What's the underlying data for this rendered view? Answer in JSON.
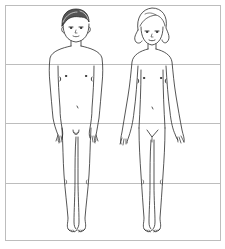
{
  "diagram": {
    "type": "figure-drawing",
    "frame": {
      "left": 5,
      "top": 5,
      "right": 220,
      "bottom": 240,
      "color": "#bdbdbd"
    },
    "band_lines_y": [
      64,
      123,
      183
    ],
    "band_count": 4,
    "stroke_color": "#2b2b2b",
    "figures": [
      {
        "id": "left-figure",
        "label": "boy",
        "hair": "dark, short",
        "center_x": 76
      },
      {
        "id": "right-figure",
        "label": "girl",
        "hair": "light, bob with side curls",
        "center_x": 152
      }
    ]
  }
}
